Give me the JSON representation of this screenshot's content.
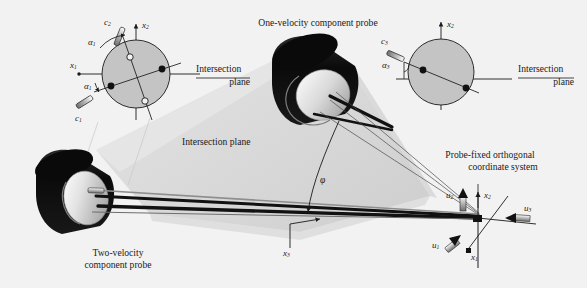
{
  "figure": {
    "background_color": "#f2f2f2",
    "plane_fill": "#d9d9d9",
    "circle_fill": "#c4c4c4",
    "probe_body_color": "#111111",
    "probe_face_color": "#d6d6d6",
    "line_color": "#1a1a1a"
  },
  "labels": {
    "one_velocity_probe": "One-velocity component probe",
    "two_velocity_probe_line1": "Two-velocity",
    "two_velocity_probe_line2": "component probe",
    "intersection_plane_center": "Intersection plane",
    "probe_fixed_line1": "Probe-fixed orthogonal",
    "probe_fixed_line2": "coordinate system"
  },
  "left_inset": {
    "intersection_line1": "Intersection",
    "intersection_line2": "plane",
    "axis_x1": "x",
    "axis_x1_sub": "1",
    "axis_x2": "x",
    "axis_x2_sub": "2",
    "wire_upper": "c",
    "wire_upper_sub": "2",
    "wire_lower": "c",
    "wire_lower_sub": "1",
    "angle_upper": "α",
    "angle_upper_sub": "1",
    "angle_lower": "α",
    "angle_lower_sub": "1"
  },
  "right_inset": {
    "intersection_line1": "Intersection",
    "intersection_line2": "plane",
    "axis_x2": "x",
    "axis_x2_sub": "2",
    "wire": "c",
    "wire_sub": "3",
    "angle": "α",
    "angle_sub": "3"
  },
  "center": {
    "phi": "φ",
    "axis_x3": "x",
    "axis_x3_sub": "3"
  },
  "coord_system": {
    "u1": "u",
    "u1_sub": "1",
    "u2": "u",
    "u2_sub": "2",
    "u3": "u",
    "u3_sub": "3",
    "x1": "x",
    "x1_sub": "1",
    "x2": "x",
    "x2_sub": "2"
  }
}
